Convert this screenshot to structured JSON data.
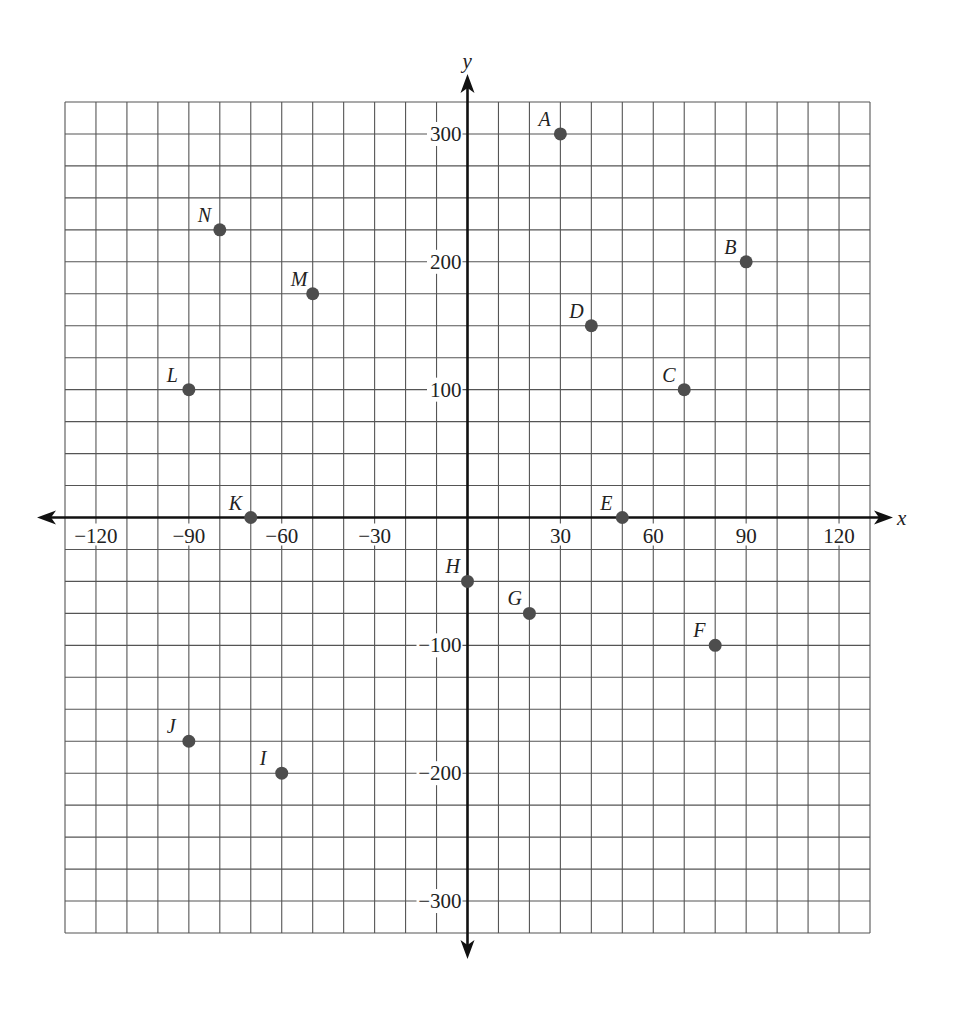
{
  "chart_data": {
    "type": "scatter",
    "title": "",
    "xlabel": "x",
    "ylabel": "y",
    "xlim": [
      -130,
      130
    ],
    "ylim": [
      -325,
      325
    ],
    "grid": true,
    "grid_step_x": 10,
    "grid_step_y": 25,
    "x_ticks": [
      -120,
      -90,
      -60,
      -30,
      30,
      60,
      90,
      120
    ],
    "x_tick_labels": [
      "−120",
      "−90",
      "−60",
      "−30",
      "30",
      "60",
      "90",
      "120"
    ],
    "y_ticks": [
      300,
      200,
      100,
      -100,
      -200,
      -300
    ],
    "y_tick_labels": [
      "300",
      "200",
      "100",
      "−100",
      "−200",
      "−300"
    ],
    "legend": null,
    "points": [
      {
        "label": "A",
        "x": 30,
        "y": 300
      },
      {
        "label": "B",
        "x": 90,
        "y": 200
      },
      {
        "label": "C",
        "x": 70,
        "y": 100
      },
      {
        "label": "D",
        "x": 40,
        "y": 150
      },
      {
        "label": "E",
        "x": 50,
        "y": 0
      },
      {
        "label": "F",
        "x": 80,
        "y": -100
      },
      {
        "label": "G",
        "x": 20,
        "y": -75
      },
      {
        "label": "H",
        "x": 0,
        "y": -50
      },
      {
        "label": "I",
        "x": -60,
        "y": -200
      },
      {
        "label": "J",
        "x": -90,
        "y": -175
      },
      {
        "label": "K",
        "x": -70,
        "y": 0
      },
      {
        "label": "L",
        "x": -90,
        "y": 100
      },
      {
        "label": "M",
        "x": -50,
        "y": 175
      },
      {
        "label": "N",
        "x": -80,
        "y": 225
      }
    ],
    "colors": {
      "point": "#4d4d4d",
      "grid": "#555555",
      "axis": "#111111"
    }
  }
}
